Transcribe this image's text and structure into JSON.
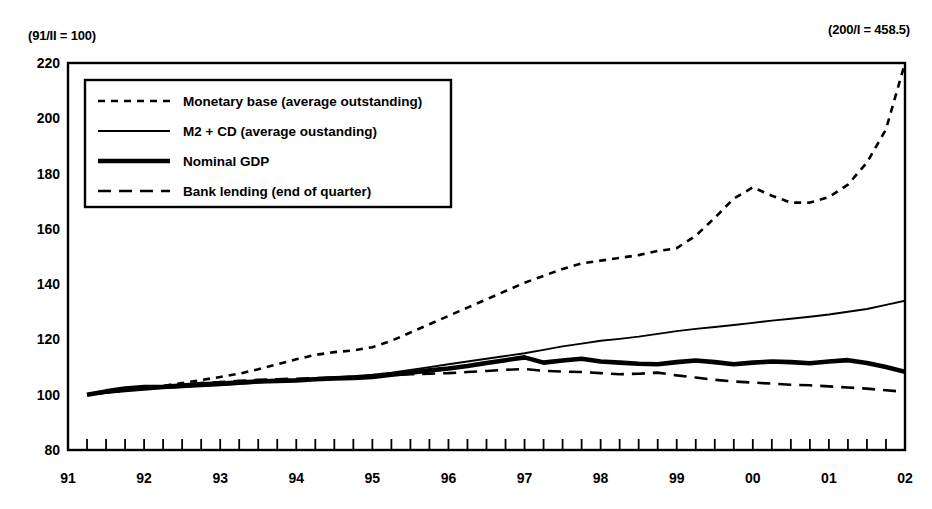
{
  "annotations": {
    "left_note": "(91/II = 100)",
    "right_note": "(200/I = 458.5)"
  },
  "legend": {
    "items": [
      {
        "label": "Monetary base (average outstanding)",
        "style": "short-dash",
        "key": "monetary_base"
      },
      {
        "label": "M2 + CD (average oustanding)",
        "style": "thin-solid",
        "key": "m2_cd"
      },
      {
        "label": "Nominal GDP",
        "style": "thick-solid",
        "key": "nominal_gdp"
      },
      {
        "label": "Bank lending (end of quarter)",
        "style": "long-dash",
        "key": "bank_lending"
      }
    ]
  },
  "chart_data": {
    "type": "line",
    "title": "",
    "xlabel": "",
    "ylabel": "",
    "ylim": [
      80,
      220
    ],
    "yticks": [
      80,
      100,
      120,
      140,
      160,
      180,
      200,
      220
    ],
    "xticks": [
      "91",
      "92",
      "93",
      "94",
      "95",
      "96",
      "97",
      "98",
      "99",
      "00",
      "01",
      "02"
    ],
    "grid": false,
    "legend_position": "upper-left-inset",
    "x_minor_ticks_per_year": 4,
    "x": [
      "91/II",
      "91/III",
      "91/IV",
      "92/I",
      "92/II",
      "92/III",
      "92/IV",
      "93/I",
      "93/II",
      "93/III",
      "93/IV",
      "94/I",
      "94/II",
      "94/III",
      "94/IV",
      "95/I",
      "95/II",
      "95/III",
      "95/IV",
      "96/I",
      "96/II",
      "96/III",
      "96/IV",
      "97/I",
      "97/II",
      "97/III",
      "97/IV",
      "98/I",
      "98/II",
      "98/III",
      "98/IV",
      "99/I",
      "99/II",
      "99/III",
      "99/IV",
      "00/I",
      "00/II",
      "00/III",
      "00/IV",
      "01/I",
      "01/II",
      "01/III",
      "01/IV",
      "02/I"
    ],
    "series": [
      {
        "name": "Monetary base (average outstanding)",
        "key": "monetary_base",
        "style": "short-dash",
        "values": [
          100.0,
          100.8,
          101.5,
          102.3,
          103.2,
          104.2,
          105.3,
          106.4,
          107.6,
          109.2,
          111.0,
          112.8,
          114.4,
          115.4,
          116.0,
          117.2,
          119.5,
          122.5,
          125.5,
          128.5,
          131.5,
          134.5,
          137.5,
          140.5,
          143.0,
          145.5,
          147.5,
          148.5,
          149.5,
          150.5,
          152.0,
          153.0,
          157.5,
          164.0,
          171.0,
          175.0,
          172.0,
          169.5,
          169.5,
          171.5,
          176.0,
          184.0,
          196.0,
          220.0
        ]
      },
      {
        "name": "M2 + CD (average oustanding)",
        "key": "m2_cd",
        "style": "thin-solid",
        "values": [
          100.0,
          100.6,
          101.2,
          101.8,
          102.3,
          102.7,
          103.0,
          103.4,
          103.9,
          104.4,
          104.9,
          105.4,
          105.9,
          106.3,
          106.7,
          107.2,
          108.0,
          109.0,
          110.0,
          111.0,
          112.0,
          113.0,
          114.0,
          115.0,
          116.2,
          117.5,
          118.5,
          119.5,
          120.2,
          121.0,
          122.0,
          123.0,
          123.8,
          124.5,
          125.2,
          126.0,
          126.8,
          127.5,
          128.2,
          129.0,
          130.0,
          131.0,
          132.5,
          134.0
        ]
      },
      {
        "name": "Nominal GDP",
        "key": "nominal_gdp",
        "style": "thick-solid",
        "values": [
          100.0,
          101.2,
          102.2,
          102.8,
          102.9,
          103.3,
          103.8,
          104.0,
          104.4,
          104.8,
          105.0,
          105.2,
          105.6,
          105.9,
          106.1,
          106.4,
          107.2,
          108.0,
          108.8,
          109.5,
          110.4,
          111.5,
          112.5,
          113.5,
          111.6,
          112.4,
          113.0,
          112.0,
          111.6,
          111.2,
          111.0,
          111.8,
          112.4,
          111.8,
          111.0,
          111.6,
          112.0,
          111.8,
          111.4,
          112.0,
          112.5,
          111.5,
          110.0,
          108.3
        ]
      },
      {
        "name": "Bank lending (end of quarter)",
        "key": "bank_lending",
        "style": "long-dash",
        "values": [
          100.0,
          100.8,
          101.6,
          102.4,
          103.0,
          103.6,
          104.2,
          104.6,
          105.0,
          105.4,
          105.6,
          105.8,
          106.0,
          106.2,
          106.4,
          106.6,
          107.0,
          107.4,
          107.6,
          107.8,
          108.2,
          108.6,
          109.0,
          109.3,
          108.6,
          108.4,
          108.2,
          107.8,
          107.4,
          107.6,
          108.0,
          107.0,
          106.2,
          105.4,
          104.8,
          104.4,
          104.0,
          103.6,
          103.4,
          103.0,
          102.6,
          102.2,
          101.6,
          101.0
        ]
      }
    ]
  }
}
